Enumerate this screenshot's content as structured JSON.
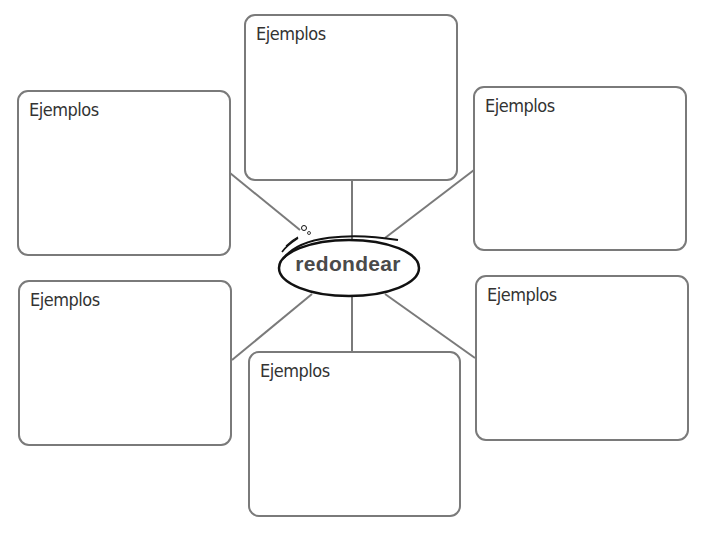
{
  "concept_map": {
    "center": {
      "label": "redondear"
    },
    "boxes": [
      {
        "position": "top-left",
        "label": "Ejemplos"
      },
      {
        "position": "top-center",
        "label": "Ejemplos"
      },
      {
        "position": "top-right",
        "label": "Ejemplos"
      },
      {
        "position": "bottom-left",
        "label": "Ejemplos"
      },
      {
        "position": "bottom-center",
        "label": "Ejemplos"
      },
      {
        "position": "bottom-right",
        "label": "Ejemplos"
      }
    ]
  },
  "colors": {
    "border": "#7a7a7a",
    "text": "#333333",
    "oval_outline": "#111111",
    "center_text": "#4a4a4a"
  }
}
